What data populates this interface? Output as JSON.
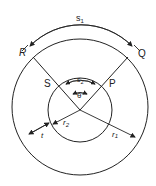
{
  "diagram": {
    "type": "concentric-circles-arc-length",
    "labels": {
      "s1": "s",
      "s1_sub": "1",
      "s2": "s",
      "s2_sub": "2",
      "theta": "θ",
      "R": "R",
      "Q": "Q",
      "S": "S",
      "P": "P",
      "r1": "r",
      "r1_sub": "1",
      "r2": "r",
      "r2_sub": "2",
      "t": "t"
    },
    "colors": {
      "stroke": "#222222",
      "background": "#ffffff"
    }
  }
}
